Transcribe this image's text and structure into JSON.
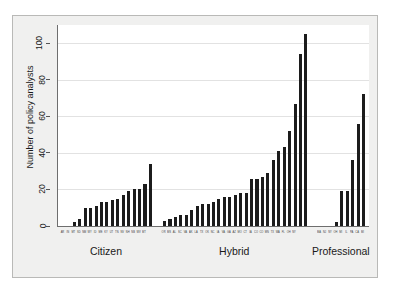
{
  "chart_data": {
    "type": "bar",
    "title": "",
    "subtitle": "",
    "xlabel": "",
    "ylabel": "Number of policy analysts",
    "ylim": [
      0,
      110
    ],
    "yticks": [
      0,
      20,
      40,
      60,
      80,
      100
    ],
    "ytick_labels": [
      "0",
      "20",
      "40",
      "60",
      "80",
      "100"
    ],
    "grid": "horizontal",
    "legend": "none",
    "bar_color": "#1c1c1c",
    "groups": [
      {
        "name": "Citizen",
        "categories": [
          "AR",
          "IN",
          "MT",
          "SD",
          "NM",
          "WY",
          "ID",
          "ME",
          "KY",
          "UT",
          "TN",
          "NV",
          "NH",
          "NB",
          "WV",
          "MT"
        ],
        "values": [
          0,
          0,
          2,
          4,
          10,
          10,
          11,
          13,
          13,
          14,
          15,
          17,
          19,
          20,
          20,
          23,
          34
        ]
      },
      {
        "name": "Hybrid",
        "categories": [
          "OR",
          "MS",
          "AL",
          "SC",
          "VA",
          "AK",
          "LA",
          "TX",
          "OK",
          "NC",
          "IA",
          "VA",
          "GA",
          "AZ",
          "MO",
          "CT",
          "IA",
          "CO",
          "CO",
          "MN",
          "TX",
          "WA",
          "FL",
          "OH",
          "NY"
        ],
        "values": [
          3,
          4,
          5,
          6,
          6,
          9,
          11,
          12,
          12,
          13,
          15,
          16,
          16,
          17,
          18,
          18,
          26,
          26,
          27,
          29,
          36,
          41,
          43,
          52,
          67,
          94,
          105
        ]
      },
      {
        "name": "Professional",
        "categories": [
          "MA",
          "NJ",
          "NY",
          "OH",
          "MI",
          "IL",
          "PA",
          "CA",
          "MI"
        ],
        "values": [
          0,
          0,
          0,
          2,
          19,
          19,
          36,
          56,
          72
        ]
      }
    ]
  },
  "axis": {
    "y_title": "Number of policy analysts"
  }
}
